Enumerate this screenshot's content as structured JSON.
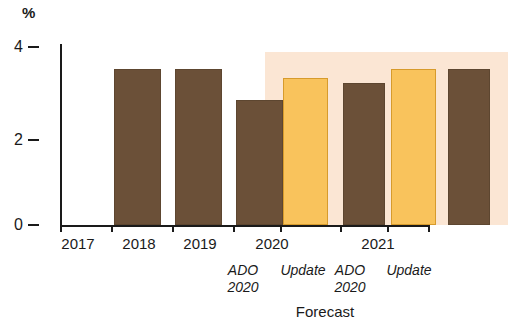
{
  "chart_data": {
    "type": "bar",
    "title": "",
    "subtitle": "",
    "xlabel": "Forecast",
    "ylabel": "%",
    "ylim": [
      0,
      4.4
    ],
    "yticks": [
      0,
      2,
      4
    ],
    "ytick_labels": [
      "0",
      "2",
      "4"
    ],
    "grid": false,
    "legend": "none",
    "categories": [
      "2017",
      "2018",
      "2019",
      "2020 ADO 2020",
      "2020 Update",
      "2021 ADO 2020",
      "2021 Update"
    ],
    "values": [
      3.5,
      3.5,
      2.8,
      3.3,
      3.2,
      3.5,
      3.5
    ],
    "bars": [
      {
        "category": "2017",
        "value": 3.5,
        "color": "#6b5038",
        "kind": "actual"
      },
      {
        "category": "2018",
        "value": 3.5,
        "color": "#6b5038",
        "kind": "actual"
      },
      {
        "category": "2019",
        "value": 2.8,
        "color": "#6b5038",
        "kind": "actual"
      },
      {
        "category": "2020 ADO 2020",
        "value": 3.3,
        "color": "#f9c35c",
        "kind": "forecast"
      },
      {
        "category": "2020 Update",
        "value": 3.2,
        "color": "#6b5038",
        "kind": "forecast"
      },
      {
        "category": "2021 ADO 2020",
        "value": 3.5,
        "color": "#f9c35c",
        "kind": "forecast"
      },
      {
        "category": "2021 Update",
        "value": 3.5,
        "color": "#6b5038",
        "kind": "forecast"
      }
    ],
    "annotations": {
      "forecast_region_label": "Forecast",
      "forecast_region_categories": [
        "2020 ADO 2020",
        "2020 Update",
        "2021 ADO 2020",
        "2021 Update"
      ]
    },
    "group_labels": [
      {
        "label": "2017",
        "sub1": "",
        "sub2": ""
      },
      {
        "label": "2018",
        "sub1": "",
        "sub2": ""
      },
      {
        "label": "2019",
        "sub1": "",
        "sub2": ""
      },
      {
        "label": "2020",
        "sub1": "ADO",
        "sub2": "2020"
      },
      {
        "label": "",
        "sub1": "Update",
        "sub2": ""
      },
      {
        "label": "2021",
        "sub1": "ADO",
        "sub2": "2020"
      },
      {
        "label": "",
        "sub1": "Update",
        "sub2": ""
      }
    ]
  },
  "axis": {
    "unit": "%",
    "tick_4": "4",
    "tick_2": "2",
    "tick_0": "0"
  },
  "labels": {
    "year_2017": "2017",
    "year_2018": "2018",
    "year_2019": "2019",
    "year_2020": "2020",
    "year_2021": "2021",
    "ado_line1": "ADO",
    "ado_line2": "2020",
    "update": "Update",
    "forecast": "Forecast"
  },
  "colors": {
    "actual_bar": "#6b5038",
    "forecast_bar": "#f9c35c",
    "forecast_band": "#fbe6d4",
    "axis": "#1a1a1a",
    "background": "#ffffff"
  }
}
